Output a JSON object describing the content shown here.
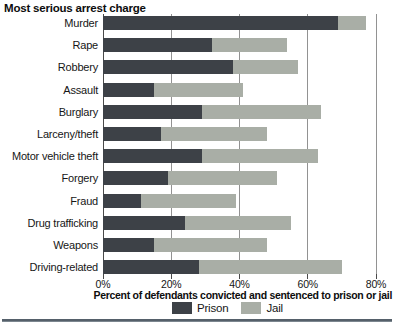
{
  "header": {
    "title": "Most serious arrest charge"
  },
  "colors": {
    "prison": "#3d4147",
    "jail": "#a9aea6",
    "gridline": "#929292",
    "zero_line": "#4a4a4a",
    "rule": "#55606a",
    "background": "#ffffff"
  },
  "chart_data": {
    "type": "bar",
    "orientation": "horizontal",
    "stacked": true,
    "title": "Most serious arrest charge",
    "xlabel": "Percent of defendants convicted and sentenced to prison or jail",
    "xlim": [
      0,
      80
    ],
    "grid": true,
    "legend_position": "bottom",
    "xticks": [
      {
        "value": 0,
        "label": "0%"
      },
      {
        "value": 20,
        "label": "20%"
      },
      {
        "value": 40,
        "label": "40%"
      },
      {
        "value": 60,
        "label": "60%"
      },
      {
        "value": 80,
        "label": "80%"
      }
    ],
    "categories": [
      "Murder",
      "Rape",
      "Robbery",
      "Assault",
      "Burglary",
      "Larceny/theft",
      "Motor vehicle theft",
      "Forgery",
      "Fraud",
      "Drug trafficking",
      "Weapons",
      "Driving-related"
    ],
    "series": [
      {
        "name": "Prison",
        "color": "#3d4147",
        "values": [
          69,
          32,
          38,
          15,
          29,
          17,
          29,
          19,
          11,
          24,
          15,
          28
        ]
      },
      {
        "name": "Jail",
        "color": "#a9aea6",
        "values": [
          8,
          22,
          19,
          26,
          35,
          31,
          34,
          32,
          28,
          31,
          33,
          42
        ]
      }
    ]
  }
}
